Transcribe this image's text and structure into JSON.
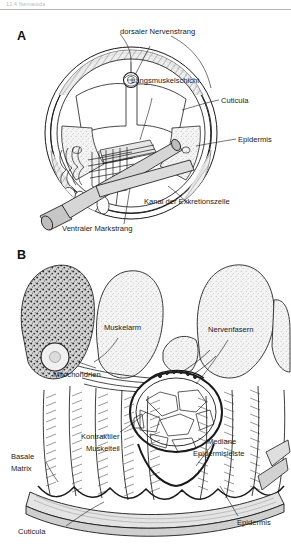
{
  "page": {
    "running_head": "12.4  Nematoda",
    "background_color": "#ffffff",
    "ink_color": "#1a1a1a"
  },
  "figure": {
    "panels": [
      {
        "id": "A",
        "letter": "A",
        "caption_title": "Querschnitt durch einen Nematoden"
      },
      {
        "id": "B",
        "letter": "B",
        "caption_title": "Feinbau von Epidermis und Muskulatur"
      }
    ]
  },
  "panel_a": {
    "letter": "A",
    "labels": [
      {
        "key": "dorsaler_nervenstrang",
        "text": "dorsaler Nervenstrang"
      },
      {
        "key": "laengsmuskelschicht",
        "text": "Längsmuskelschicht"
      },
      {
        "key": "cuticula",
        "text": "Cuticula"
      },
      {
        "key": "epidermis",
        "text": "Epidermis"
      },
      {
        "key": "kanal_exkretionszelle",
        "text": "Kanal der Exkretionszelle"
      },
      {
        "key": "ventraler_markstrang",
        "text": "Ventraler Markstrang"
      }
    ]
  },
  "panel_b": {
    "letter": "B",
    "labels": [
      {
        "key": "muskelarm",
        "text": "Muskelarm"
      },
      {
        "key": "nervenfasern",
        "text": "Nervenfasern"
      },
      {
        "key": "mitochondrien",
        "text": "Mitochondrien"
      },
      {
        "key": "kontraktiler_1",
        "text": "Kontraktiler"
      },
      {
        "key": "kontraktiler_2",
        "text": "Muskelteil"
      },
      {
        "key": "mediane",
        "text": "Mediane"
      },
      {
        "key": "epidermisleiste",
        "text": "Epidermisleiste"
      },
      {
        "key": "basale",
        "text": "Basale"
      },
      {
        "key": "matrix",
        "text": "Matrix"
      },
      {
        "key": "cuticula",
        "text": "Cuticula"
      },
      {
        "key": "epidermis",
        "text": "Epidermis"
      }
    ]
  },
  "colors": {
    "line": "#1a1a1a",
    "fill_light": "#f2f2f2",
    "fill_mid": "#d8d8d8",
    "fill_dark": "#a8a8a8",
    "rule": "#b5b5b5",
    "runhead_text": "#b9b9b9"
  }
}
